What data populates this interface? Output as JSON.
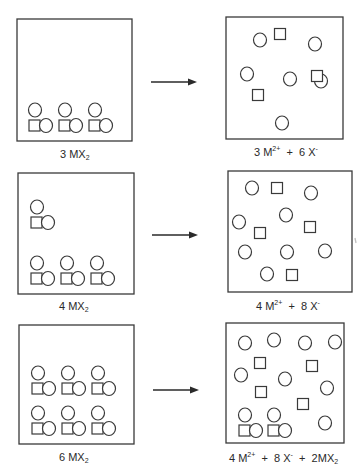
{
  "figure": {
    "rows": [
      {
        "left_label": {
          "coef": "3",
          "formula": "MX",
          "sub": "2"
        },
        "right_label": {
          "terms": [
            {
              "coef": "3",
              "species": "M",
              "sup": "2+"
            },
            {
              "coef": "6",
              "species": "X",
              "sup": "-"
            }
          ]
        },
        "solid_units": 3,
        "dissolved": {
          "cations": 3,
          "anions": 6
        },
        "remaining_solid": 0
      },
      {
        "left_label": {
          "coef": "4",
          "formula": "MX",
          "sub": "2"
        },
        "right_label": {
          "terms": [
            {
              "coef": "4",
              "species": "M",
              "sup": "2+"
            },
            {
              "coef": "8",
              "species": "X",
              "sup": "-"
            }
          ]
        },
        "solid_units": 4,
        "dissolved": {
          "cations": 4,
          "anions": 8
        },
        "remaining_solid": 0
      },
      {
        "left_label": {
          "coef": "6",
          "formula": "MX",
          "sub": "2"
        },
        "right_label": {
          "terms": [
            {
              "coef": "4",
              "species": "M",
              "sup": "2+"
            },
            {
              "coef": "8",
              "species": "X",
              "sup": "-"
            },
            {
              "coef": "2",
              "species": "MX",
              "sub": "2"
            }
          ]
        },
        "solid_units": 6,
        "dissolved": {
          "cations": 4,
          "anions": 8
        },
        "remaining_solid": 2
      }
    ],
    "plus_sign": "+",
    "legend": {
      "square": "M (cation)",
      "circle": "X (anion)"
    }
  }
}
